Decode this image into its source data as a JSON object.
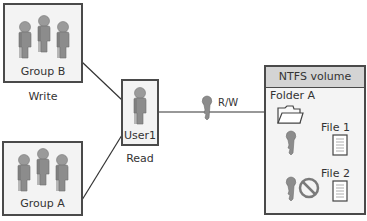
{
  "groups": {
    "group_b": {
      "label": "Group B",
      "permission": "Write"
    },
    "group_a": {
      "label": "Group A"
    }
  },
  "user": {
    "label": "User1",
    "permission": "Read"
  },
  "connection": {
    "label": "R/W"
  },
  "volume": {
    "title": "NTFS volume",
    "folder": {
      "label": "Folder A"
    },
    "files": [
      {
        "label": "File 1",
        "access": "allowed"
      },
      {
        "label": "File 2",
        "access": "denied"
      }
    ]
  },
  "colors": {
    "box_fill": "#f3f3f3",
    "border": "#4a4a4a",
    "header_fill": "#d4d4d4",
    "figure": "#8c8c8c",
    "deny": "#7a7a7a"
  }
}
